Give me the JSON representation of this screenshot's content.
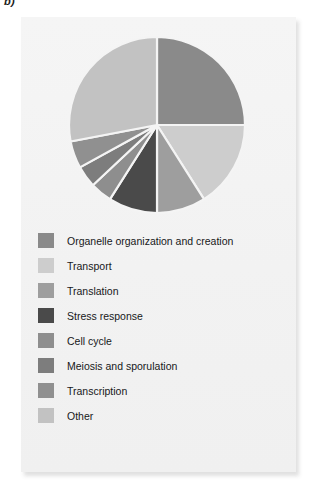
{
  "figure": {
    "label": "b)"
  },
  "chart_data": {
    "type": "pie",
    "title": "",
    "xlabel": "",
    "ylabel": "",
    "legend_position": "below",
    "grid": false,
    "start_angle_deg": 0,
    "direction": "clockwise",
    "categories": [
      "Organelle organization and creation",
      "Transport",
      "Translation",
      "Stress response",
      "Cell cycle",
      "Meiosis and sporulation",
      "Transcription",
      "Other"
    ],
    "colors": [
      "#8a8a8a",
      "#cdcdcd",
      "#9e9e9e",
      "#4a4a4a",
      "#8e8e8e",
      "#7d7d7d",
      "#909090",
      "#c2c2c2"
    ],
    "values": [
      25,
      16,
      9,
      9,
      4,
      4,
      5,
      28
    ],
    "slices": [
      {
        "label": "Organelle organization and creation",
        "value": 25,
        "color": "#8a8a8a"
      },
      {
        "label": "Transport",
        "value": 16,
        "color": "#cdcdcd"
      },
      {
        "label": "Translation",
        "value": 9,
        "color": "#9e9e9e"
      },
      {
        "label": "Stress response",
        "value": 9,
        "color": "#4a4a4a"
      },
      {
        "label": "Cell cycle",
        "value": 4,
        "color": "#8e8e8e"
      },
      {
        "label": "Meiosis and sporulation",
        "value": 4,
        "color": "#7d7d7d"
      },
      {
        "label": "Transcription",
        "value": 5,
        "color": "#909090"
      },
      {
        "label": "Other",
        "value": 28,
        "color": "#c2c2c2"
      }
    ]
  },
  "legend": {
    "items": [
      {
        "label": "Organelle organization and creation",
        "color": "#8a8a8a"
      },
      {
        "label": "Transport",
        "color": "#cdcdcd"
      },
      {
        "label": "Translation",
        "color": "#9e9e9e"
      },
      {
        "label": "Stress response",
        "color": "#4a4a4a"
      },
      {
        "label": "Cell cycle",
        "color": "#8e8e8e"
      },
      {
        "label": "Meiosis and sporulation",
        "color": "#7d7d7d"
      },
      {
        "label": "Transcription",
        "color": "#909090"
      },
      {
        "label": "Other",
        "color": "#c2c2c2"
      }
    ]
  }
}
